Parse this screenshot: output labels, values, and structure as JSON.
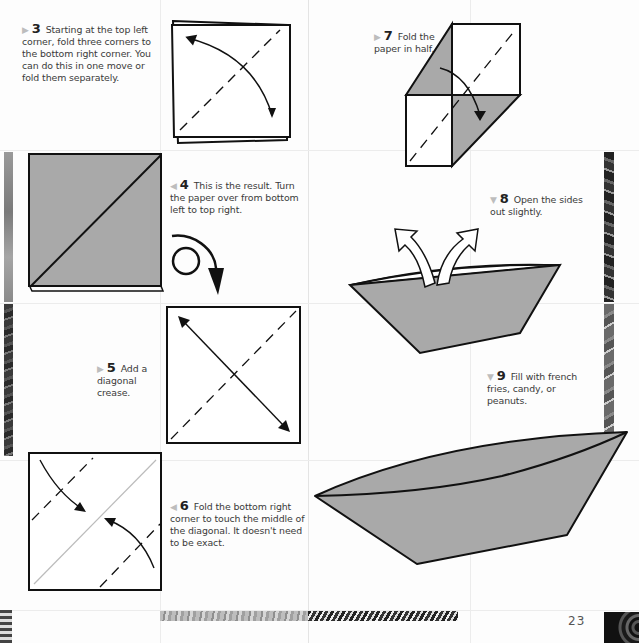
{
  "page": {
    "number": "23",
    "colors": {
      "paper_gray": "#a9a9a9",
      "line": "#111111",
      "text": "#3a3a3a",
      "marker": "#bdbdbd"
    }
  },
  "steps": [
    {
      "num": "3",
      "marker": "right-triangle",
      "text": "Starting at the top left corner, fold three corners to the bottom right corner. You can do this in one move or fold them separately."
    },
    {
      "num": "4",
      "marker": "left-triangle",
      "text": "This is the result. Turn the paper over from bottom left to top right."
    },
    {
      "num": "5",
      "marker": "right-triangle",
      "text": "Add a diagonal crease."
    },
    {
      "num": "6",
      "marker": "left-triangle",
      "text": "Fold the bottom right corner to touch the middle of the diagonal. It doesn't need to be exact."
    },
    {
      "num": "7",
      "marker": "right-triangle",
      "text": "Fold the paper in half."
    },
    {
      "num": "8",
      "marker": "down-triangle",
      "text": "Open the sides out slightly."
    },
    {
      "num": "9",
      "marker": "down-triangle",
      "text": "Fill with french fries, candy, or peanuts."
    }
  ],
  "markers": {
    "right": "▶",
    "left": "◀",
    "down": "▼"
  },
  "illustrations": [
    {
      "step": "3",
      "description": "layered square with dashed diagonal and curved double arrow"
    },
    {
      "step": "4",
      "description": "gray square with diagonal line"
    },
    {
      "step": "4-turn",
      "description": "turn-over loop arrow"
    },
    {
      "step": "5",
      "description": "white square with dashed diagonal and straight double arrow"
    },
    {
      "step": "6",
      "description": "square with two dashed fold lines and curved arrows toward center diagonal"
    },
    {
      "step": "7",
      "description": "folded shape with two gray triangles, dashed diagonal and curved arrow"
    },
    {
      "step": "8",
      "description": "gray boat shape with two outline arrows pointing out"
    },
    {
      "step": "9",
      "description": "finished gray boat"
    }
  ]
}
